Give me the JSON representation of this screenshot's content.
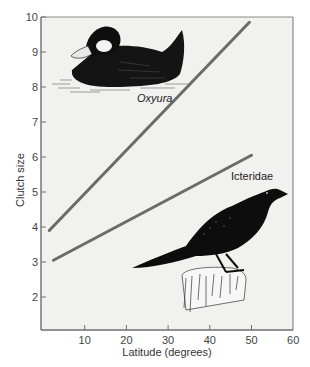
{
  "chart_data": {
    "type": "line",
    "title": "",
    "xlabel": "Latitude (degrees)",
    "ylabel": "Clutch size",
    "xlim": [
      0,
      60
    ],
    "ylim": [
      1,
      10
    ],
    "xticks": [
      10,
      20,
      30,
      40,
      50,
      60
    ],
    "yticks": [
      2,
      3,
      4,
      5,
      6,
      7,
      8,
      9,
      10
    ],
    "grid": false,
    "legend": "none (series labeled inline)",
    "series": [
      {
        "name": "Oxyura",
        "label_style": "italic",
        "color": "#6b6b6b",
        "x": [
          1.5,
          49.5
        ],
        "y": [
          3.9,
          9.85
        ]
      },
      {
        "name": "Icteridae",
        "label_style": "normal",
        "color": "#6b6b6b",
        "x": [
          2.5,
          50
        ],
        "y": [
          3.05,
          6.05
        ]
      }
    ],
    "annotations": [
      {
        "text": "Oxyura",
        "near_series": "Oxyura",
        "illustration": "duck (ruddy duck) drawing, upper left"
      },
      {
        "text": "Icteridae",
        "near_series": "Icteridae",
        "illustration": "blackbird perched on post drawing, lower right"
      }
    ]
  },
  "colors": {
    "plot_background": "#f1f1ef",
    "axis": "#7a7a7a",
    "line": "#6b6b6b",
    "illustration": "#111111"
  }
}
